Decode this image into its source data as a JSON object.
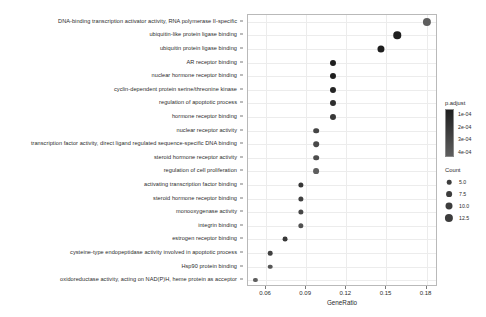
{
  "chart_data": {
    "type": "scatter",
    "title": "",
    "xlabel": "GeneRatio",
    "ylabel": "",
    "xlim": [
      0.0465,
      0.1885
    ],
    "xticks": [
      0.06,
      0.09,
      0.12,
      0.15,
      0.18
    ],
    "xticklabels": [
      "0.06",
      "0.09",
      "0.12",
      "0.15",
      "0.18"
    ],
    "grid": true,
    "legend_position": "right",
    "categories": [
      "DNA-binding transcription activator activity, RNA polymerase II-specific",
      "ubiquitin-like protein ligase binding",
      "ubiquitin protein ligase binding",
      "AR receptor binding",
      "nuclear hormone receptor binding",
      "cyclin-dependent protein serine/threonine kinase",
      "regulation of apoptotic process",
      "hormone receptor binding",
      "nuclear receptor activity",
      "transcription factor activity, direct ligand regulated sequence-specific DNA binding",
      "steroid hormone receptor activity",
      "regulation of cell proliferation",
      "activating transcription factor binding",
      "steroid hormone receptor binding",
      "monooxygenase activity",
      "integrin binding",
      "estrogen receptor binding",
      "cysteine-type endopeptidase activity involved in apoptotic process",
      "Hsp90 protein binding",
      "oxidoreductase activity, acting on NAD(P)H, heme protein as acceptor"
    ],
    "points": [
      {
        "term": "DNA-binding transcription activator activity, RNA polymerase II-specific",
        "GeneRatio": 0.18,
        "Count": 12.5,
        "p.adjust": 0.0004
      },
      {
        "term": "ubiquitin-like protein ligase binding",
        "GeneRatio": 0.158,
        "Count": 11.0,
        "p.adjust": 0.0001
      },
      {
        "term": "ubiquitin protein ligase binding",
        "GeneRatio": 0.146,
        "Count": 10.2,
        "p.adjust": 0.0001
      },
      {
        "term": "AR receptor binding",
        "GeneRatio": 0.11,
        "Count": 8.0,
        "p.adjust": 0.0001
      },
      {
        "term": "nuclear hormone receptor binding",
        "GeneRatio": 0.11,
        "Count": 8.0,
        "p.adjust": 0.0001
      },
      {
        "term": "cyclin-dependent protein serine/threonine kinase",
        "GeneRatio": 0.11,
        "Count": 8.0,
        "p.adjust": 0.00013
      },
      {
        "term": "regulation of apoptotic process",
        "GeneRatio": 0.11,
        "Count": 8.0,
        "p.adjust": 0.00017
      },
      {
        "term": "hormone receptor binding",
        "GeneRatio": 0.11,
        "Count": 8.0,
        "p.adjust": 0.00022
      },
      {
        "term": "nuclear receptor activity",
        "GeneRatio": 0.0975,
        "Count": 7.2,
        "p.adjust": 0.00028
      },
      {
        "term": "transcription factor activity, direct ligand regulated sequence-specific DNA binding",
        "GeneRatio": 0.0975,
        "Count": 7.2,
        "p.adjust": 0.0003
      },
      {
        "term": "steroid hormone receptor activity",
        "GeneRatio": 0.0975,
        "Count": 7.2,
        "p.adjust": 0.00032
      },
      {
        "term": "regulation of cell proliferation",
        "GeneRatio": 0.0975,
        "Count": 7.6,
        "p.adjust": 0.0004
      },
      {
        "term": "activating transcription factor binding",
        "GeneRatio": 0.086,
        "Count": 6.4,
        "p.adjust": 0.00021
      },
      {
        "term": "steroid hormone receptor binding",
        "GeneRatio": 0.086,
        "Count": 6.4,
        "p.adjust": 0.00026
      },
      {
        "term": "monooxygenase activity",
        "GeneRatio": 0.086,
        "Count": 6.4,
        "p.adjust": 0.00029
      },
      {
        "term": "integrin binding",
        "GeneRatio": 0.086,
        "Count": 6.6,
        "p.adjust": 0.00034
      },
      {
        "term": "estrogen receptor binding",
        "GeneRatio": 0.0745,
        "Count": 5.6,
        "p.adjust": 0.00022
      },
      {
        "term": "cysteine-type endopeptidase activity involved in apoptotic process",
        "GeneRatio": 0.063,
        "Count": 5.0,
        "p.adjust": 0.00026
      },
      {
        "term": "Hsp90 protein binding",
        "GeneRatio": 0.063,
        "Count": 5.0,
        "p.adjust": 0.00036
      },
      {
        "term": "oxidoreductase activity, acting on NAD(P)H, heme protein as acceptor",
        "GeneRatio": 0.052,
        "Count": 4.2,
        "p.adjust": 0.0004
      }
    ],
    "color_legend": {
      "title": "p.adjust",
      "ticks": [
        0.0001,
        0.0002,
        0.0003,
        0.0004
      ],
      "ticklabels": [
        "1e-04",
        "2e-04",
        "3e-04",
        "4e-04"
      ],
      "low_color": "#1f1f1f",
      "high_color": "#5e5e5e"
    },
    "size_legend": {
      "title": "Count",
      "values": [
        5.0,
        7.5,
        10.0,
        12.5
      ],
      "labels": [
        "5.0",
        "7.5",
        "10.0",
        "12.5"
      ]
    }
  }
}
